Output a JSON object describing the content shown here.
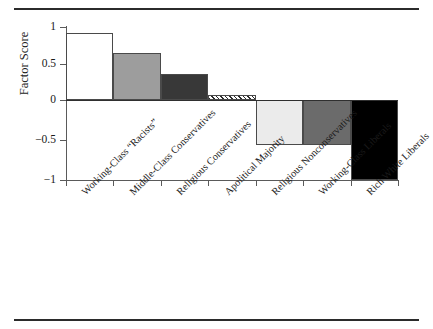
{
  "chart_data": {
    "type": "bar",
    "title": "",
    "subtitle": "",
    "xlabel": "",
    "ylabel": "Factor Score",
    "ylim": [
      -1,
      1
    ],
    "yticks": [
      1,
      0.5,
      0,
      -0.5,
      -1
    ],
    "ytick_labels": [
      "1",
      "0.5",
      "0",
      "−0.5",
      "−1"
    ],
    "grid": false,
    "legend": "none",
    "categories": [
      "Working-Class “Racists”",
      "Middle-Class Conservatives",
      "Religious Conservatives",
      "Apolitical Majority",
      "Religious Nonconservatives",
      "Working-Class Liberals",
      "Rich White Liberals"
    ],
    "values": [
      0.92,
      0.65,
      0.35,
      0.07,
      -0.56,
      -0.56,
      -1.0
    ],
    "bar_fills": [
      "#ffffff",
      "#9d9d9d",
      "#383838",
      "hatched",
      "#ebebeb",
      "#6b6b6b",
      "#000000"
    ],
    "bar_edge_color": "#4a4a4a",
    "axis_color": "#5a5a5a",
    "zero_line_color": "#2f2f2f",
    "rule_color": "#2b2b2b"
  }
}
